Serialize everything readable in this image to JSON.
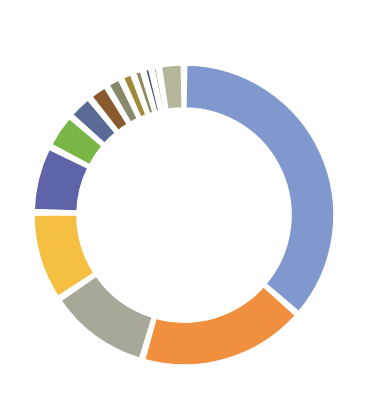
{
  "chart_data": {
    "type": "pie",
    "variant": "donut",
    "title": "",
    "subtitle": "",
    "xlabel": "",
    "ylabel": "",
    "legend": "none",
    "grid": false,
    "labels_shown": false,
    "start_angle_deg": 0,
    "direction": "clockwise",
    "center_x": 184,
    "center_y": 215,
    "outer_radius": 150,
    "inner_radius": 107,
    "gap_deg": 2,
    "categories": [
      "Segment 1",
      "Segment 2",
      "Segment 3",
      "Segment 4",
      "Segment 5",
      "Segment 6",
      "Segment 7",
      "Segment 8",
      "Segment 9",
      "Segment 10",
      "Segment 11",
      "Segment 12",
      "Segment 13",
      "Segment 14"
    ],
    "values": [
      36.4,
      18.1,
      11.1,
      9.7,
      7.2,
      3.9,
      2.8,
      2.2,
      1.7,
      1.4,
      1.1,
      0.9,
      0.8,
      2.7
    ],
    "percentages": [
      "36.4%",
      "18.1%",
      "11.1%",
      "9.7%",
      "7.2%",
      "3.9%",
      "2.8%",
      "2.2%",
      "1.7%",
      "1.4%",
      "1.1%",
      "0.9%",
      "0.8%",
      "2.7%"
    ],
    "colors": [
      "#8198ce",
      "#f0903f",
      "#a8a89a",
      "#f5bf42",
      "#5f63a8",
      "#7ab648",
      "#5a6a96",
      "#8a5a2e",
      "#88886a",
      "#a08a3a",
      "#8b8b5e",
      "#3e4468",
      "#9a9a86",
      "#b5b59a"
    ],
    "ylim": [
      0,
      100
    ],
    "total": 100
  },
  "canvas": {
    "background": "#ffffff",
    "width": 371,
    "height": 412
  }
}
